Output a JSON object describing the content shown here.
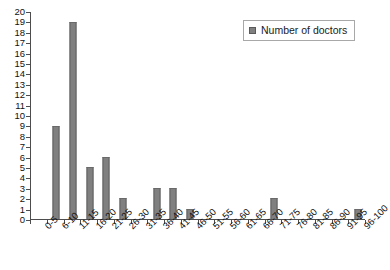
{
  "chart_data": {
    "type": "bar",
    "title": "",
    "subtitle": "",
    "xlabel": "",
    "ylabel": "",
    "categories": [
      "0-5",
      "6-10",
      "11-15",
      "16-20",
      "21-25",
      "26-30",
      "31-35",
      "36-40",
      "41-45",
      "46-50",
      "51-55",
      "56-60",
      "61-65",
      "66-70",
      "71-75",
      "76-80",
      "81-85",
      "86-90",
      "91-95",
      "96-100"
    ],
    "values": [
      0,
      9,
      19,
      5,
      6,
      2,
      0,
      3,
      3,
      1,
      0,
      0,
      0,
      0,
      2,
      0,
      0,
      0,
      0,
      1
    ],
    "series": [
      {
        "name": "Number of doctors",
        "values": [
          0,
          9,
          19,
          5,
          6,
          2,
          0,
          3,
          3,
          1,
          0,
          0,
          0,
          0,
          2,
          0,
          0,
          0,
          0,
          1
        ]
      }
    ],
    "ylim": [
      0,
      20
    ],
    "ytick_step": 1,
    "yticks": [
      0,
      1,
      2,
      3,
      4,
      5,
      6,
      7,
      8,
      9,
      10,
      11,
      12,
      13,
      14,
      15,
      16,
      17,
      18,
      19,
      20
    ],
    "grid": false,
    "legend_position": "top-right",
    "legend_entries": [
      "Number of doctors"
    ],
    "bar_color": "#808080",
    "bar_edge_color": "#606060",
    "axis_color": "#4d4d4d",
    "background_color": "#ffffff",
    "xtick_label_rotation": -45
  },
  "legend": {
    "label": "Number of doctors"
  }
}
